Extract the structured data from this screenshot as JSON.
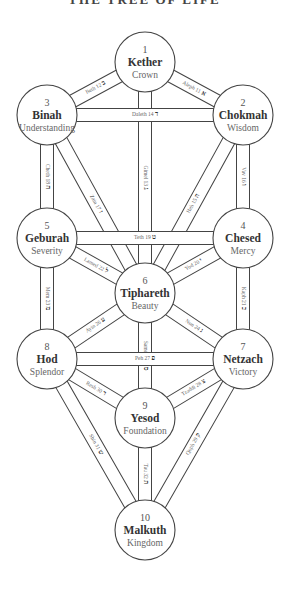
{
  "title": "THE TREE OF LIFE",
  "colors": {
    "stroke": "#444444",
    "background": "#ffffff",
    "text": "#333333"
  },
  "sephiroth": [
    {
      "id": 1,
      "number": "1",
      "name": "Kether",
      "meaning": "Crown",
      "cx": 145,
      "cy": 62
    },
    {
      "id": 2,
      "number": "2",
      "name": "Chokmah",
      "meaning": "Wisdom",
      "cx": 243,
      "cy": 115
    },
    {
      "id": 3,
      "number": "3",
      "name": "Binah",
      "meaning": "Understanding",
      "cx": 47,
      "cy": 115
    },
    {
      "id": 4,
      "number": "4",
      "name": "Chesed",
      "meaning": "Mercy",
      "cx": 243,
      "cy": 238
    },
    {
      "id": 5,
      "number": "5",
      "name": "Geburah",
      "meaning": "Severity",
      "cx": 47,
      "cy": 238
    },
    {
      "id": 6,
      "number": "6",
      "name": "Tiphareth",
      "meaning": "Beauty",
      "cx": 145,
      "cy": 293
    },
    {
      "id": 7,
      "number": "7",
      "name": "Netzach",
      "meaning": "Victory",
      "cx": 243,
      "cy": 359
    },
    {
      "id": 8,
      "number": "8",
      "name": "Hod",
      "meaning": "Splendor",
      "cx": 47,
      "cy": 359
    },
    {
      "id": 9,
      "number": "9",
      "name": "Yesod",
      "meaning": "Foundation",
      "cx": 145,
      "cy": 418
    },
    {
      "id": 10,
      "number": "10",
      "name": "Malkuth",
      "meaning": "Kingdom",
      "cx": 145,
      "cy": 530
    }
  ],
  "paths": [
    {
      "num": "11",
      "letter": "Aleph",
      "glyph": "א",
      "from": 1,
      "to": 2
    },
    {
      "num": "12",
      "letter": "Beth",
      "glyph": "ב",
      "from": 1,
      "to": 3
    },
    {
      "num": "13",
      "letter": "Gimel",
      "glyph": "ג",
      "from": 1,
      "to": 6
    },
    {
      "num": "14",
      "letter": "Daleth",
      "glyph": "ד",
      "from": 2,
      "to": 3
    },
    {
      "num": "15",
      "letter": "Heh",
      "glyph": "ה",
      "from": 2,
      "to": 6
    },
    {
      "num": "16",
      "letter": "Vav",
      "glyph": "ו",
      "from": 2,
      "to": 4
    },
    {
      "num": "17",
      "letter": "Zain",
      "glyph": "ז",
      "from": 3,
      "to": 6
    },
    {
      "num": "18",
      "letter": "Cheth",
      "glyph": "ח",
      "from": 3,
      "to": 5
    },
    {
      "num": "19",
      "letter": "Teth",
      "glyph": "ט",
      "from": 4,
      "to": 5
    },
    {
      "num": "20",
      "letter": "Yod",
      "glyph": "י",
      "from": 4,
      "to": 6
    },
    {
      "num": "21",
      "letter": "Kaph",
      "glyph": "כ",
      "from": 4,
      "to": 7
    },
    {
      "num": "22",
      "letter": "Lamed",
      "glyph": "ל",
      "from": 5,
      "to": 6
    },
    {
      "num": "23",
      "letter": "Mem",
      "glyph": "מ",
      "from": 5,
      "to": 8
    },
    {
      "num": "24",
      "letter": "Nun",
      "glyph": "נ",
      "from": 6,
      "to": 7
    },
    {
      "num": "25",
      "letter": "Samekh",
      "glyph": "ס",
      "from": 6,
      "to": 9
    },
    {
      "num": "26",
      "letter": "Ayin",
      "glyph": "ע",
      "from": 6,
      "to": 8
    },
    {
      "num": "27",
      "letter": "Peh",
      "glyph": "פ",
      "from": 7,
      "to": 8
    },
    {
      "num": "28",
      "letter": "Tzaddi",
      "glyph": "צ",
      "from": 7,
      "to": 9
    },
    {
      "num": "29",
      "letter": "Qoph",
      "glyph": "ק",
      "from": 7,
      "to": 10
    },
    {
      "num": "30",
      "letter": "Resh",
      "glyph": "ר",
      "from": 8,
      "to": 9
    },
    {
      "num": "31",
      "letter": "Shin",
      "glyph": "ש",
      "from": 8,
      "to": 10
    },
    {
      "num": "32",
      "letter": "Tau",
      "glyph": "ת",
      "from": 9,
      "to": 10
    }
  ]
}
